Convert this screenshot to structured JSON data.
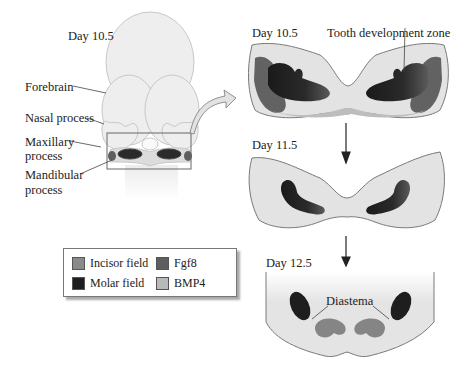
{
  "labels": {
    "left_day": "Day 10.5",
    "forebrain": "Forebrain",
    "nasal": "Nasal process",
    "maxillary_1": "Maxillary",
    "maxillary_2": "process",
    "mandibular_1": "Mandibular",
    "mandibular_2": "process",
    "panel1_day": "Day 10.5",
    "tooth_zone": "Tooth development zone",
    "panel2_day": "Day 11.5",
    "panel3_day": "Day 12.5",
    "diastema": "Diastema"
  },
  "legend": {
    "items": [
      {
        "label": "Incisor field",
        "color": "#8a8a8a"
      },
      {
        "label": "Fgf8",
        "color": "#5e5e5e"
      },
      {
        "label": "Molar field",
        "color": "#1e1e1e"
      },
      {
        "label": "BMP4",
        "color": "#b9b9b9"
      }
    ]
  },
  "colors": {
    "tissue": "#e2e2e2",
    "outline": "#7a7a7a",
    "molar": "#222222",
    "incisor": "#858585",
    "fgf8": "#626262",
    "bmp4": "#bdbdbd"
  }
}
